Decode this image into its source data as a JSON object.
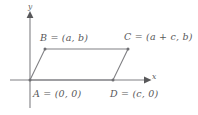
{
  "figure": {
    "type": "coordinate-geometry-diagram",
    "background_color": "#ffffff",
    "stroke_color": "#808084",
    "text_color": "#58585a"
  },
  "axes": {
    "x_label": "x",
    "y_label": "y",
    "x_axis": {
      "x1": 10,
      "y1": 80,
      "x2": 148,
      "y2": 80,
      "arrow": "right"
    },
    "y_axis": {
      "x1": 30,
      "y1": 108,
      "x2": 30,
      "y2": 14,
      "arrow": "up"
    }
  },
  "vertices": [
    {
      "id": "A",
      "label": "A = (0, 0)",
      "px": 30,
      "py": 80
    },
    {
      "id": "B",
      "label": "B = (a, b)",
      "px": 45,
      "py": 49
    },
    {
      "id": "C",
      "label": "C = (a + c, b)",
      "px": 128,
      "py": 49
    },
    {
      "id": "D",
      "label": "D = (c, 0)",
      "px": 113,
      "py": 80
    }
  ],
  "edges": [
    {
      "from": "A",
      "to": "B"
    },
    {
      "from": "B",
      "to": "C"
    },
    {
      "from": "C",
      "to": "D"
    },
    {
      "from": "D",
      "to": "A"
    }
  ]
}
